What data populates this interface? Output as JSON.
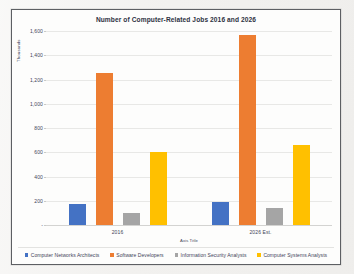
{
  "chart_data": {
    "type": "bar",
    "title": "Number of Computer-Related Jobs 2016 and 2026",
    "xlabel": "Axis Title",
    "ylabel": "Thousands",
    "categories": [
      "2016",
      "2026 Est."
    ],
    "series": [
      {
        "name": "Computer Networks Architects",
        "color": "#4472C4",
        "values": [
          170,
          190
        ]
      },
      {
        "name": "Software Developers",
        "color": "#ED7D31",
        "values": [
          1256,
          1570
        ]
      },
      {
        "name": "Information Security Analysts",
        "color": "#A5A5A5",
        "values": [
          100,
          141
        ]
      },
      {
        "name": "Computer Systems Analysts",
        "color": "#FFC000",
        "values": [
          600,
          657
        ]
      }
    ],
    "ylim": [
      0,
      1600
    ],
    "yticks": [
      0,
      200,
      400,
      600,
      800,
      1000,
      1200,
      1400,
      1600
    ],
    "ytick_labels": [
      "-",
      "200",
      "400",
      "600",
      "800",
      "1,000",
      "1,200",
      "1,400",
      "1,600"
    ],
    "grid": true,
    "legend_position": "bottom"
  }
}
